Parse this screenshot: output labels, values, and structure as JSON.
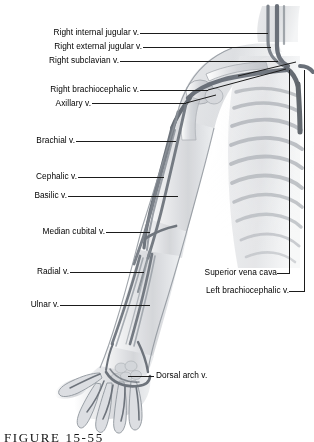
{
  "figure": {
    "caption": "FIGURE 15-55",
    "colors": {
      "ink": "#1b1b1b",
      "vessel_dark": "#5a5f66",
      "vessel_mid": "#8b9199",
      "tissue_light": "#d8dade",
      "bone": "#c2c5ca",
      "background": "#ffffff"
    }
  },
  "labels": {
    "left": [
      {
        "id": "right-internal-jugular",
        "text": "Right internal jugular v."
      },
      {
        "id": "right-external-jugular",
        "text": "Right external jugular v."
      },
      {
        "id": "right-subclavian",
        "text": "Right subclavian v."
      },
      {
        "id": "right-brachiocephalic",
        "text": "Right brachiocephalic v."
      },
      {
        "id": "axillary",
        "text": "Axillary v."
      },
      {
        "id": "brachial",
        "text": "Brachial v."
      },
      {
        "id": "cephalic",
        "text": "Cephalic v."
      },
      {
        "id": "basilic",
        "text": "Basilic v."
      },
      {
        "id": "median-cubital",
        "text": "Median cubital v."
      },
      {
        "id": "radial",
        "text": "Radial v."
      },
      {
        "id": "ulnar",
        "text": "Ulnar v."
      }
    ],
    "right": [
      {
        "id": "superior-vena-cava",
        "text": "Superior vena cava"
      },
      {
        "id": "left-brachiocephalic",
        "text": "Left brachiocephalic v."
      },
      {
        "id": "dorsal-arch",
        "text": "Dorsal arch v."
      }
    ]
  }
}
